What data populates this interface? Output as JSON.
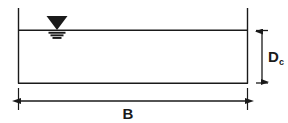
{
  "figure": {
    "type": "engineering-cross-section-diagram",
    "background_color": "#ffffff",
    "line_color": "#1a1a1a",
    "labels": {
      "depth_symbol": "D",
      "depth_subscript": "c",
      "width_symbol": "B"
    },
    "geometry": {
      "channel_left_x": 18,
      "channel_right_x": 248,
      "channel_wall_top_y": 8,
      "channel_bottom_y": 83,
      "water_surface_y": 30,
      "depth_dimension_x": 262,
      "width_dimension_y": 101,
      "water_symbol_center_x": 57
    },
    "icons": {
      "water_surface": "water-surface-triangle-icon",
      "depth_dimension": "vertical-dimension-arrow-icon",
      "width_dimension": "horizontal-dimension-arrow-icon"
    }
  }
}
